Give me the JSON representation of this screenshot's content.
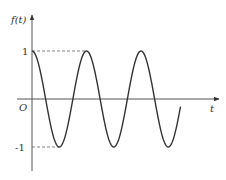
{
  "chart_data": {
    "type": "line",
    "title": "",
    "function": "f(t) = cos(t)",
    "xlabel": "t",
    "ylabel": "f(t)",
    "origin_label": "O",
    "y_ticks": [
      {
        "value": 1,
        "label": "1"
      },
      {
        "value": -1,
        "label": "-1"
      }
    ],
    "series": [
      {
        "name": "f(t)",
        "description": "cosine wave starting at maximum 1, oscillating between 1 and -1, about 2.73 periods shown",
        "key_points": [
          {
            "t_periods": 0,
            "value": 1
          },
          {
            "t_periods": 0.5,
            "value": -1
          },
          {
            "t_periods": 1,
            "value": 1
          },
          {
            "t_periods": 1.5,
            "value": -1
          },
          {
            "t_periods": 2,
            "value": 1
          },
          {
            "t_periods": 2.5,
            "value": -1
          },
          {
            "t_periods": 2.73,
            "value": 0.28
          }
        ]
      }
    ],
    "ylim": [
      -1.2,
      1.8
    ],
    "grid": false,
    "legend": "none",
    "annotations": [
      {
        "type": "dashed-line",
        "from": "y-axis at 1",
        "to": "second peak"
      },
      {
        "type": "dashed-line",
        "from": "y-axis at -1",
        "to": "first trough"
      }
    ]
  },
  "labels": {
    "y_axis": "f(t)",
    "x_axis": "t",
    "origin": "O",
    "tick_pos": "1",
    "tick_neg": "-1"
  },
  "colors": {
    "axis": "#555555",
    "curve": "#333333",
    "dashed": "#666666"
  }
}
